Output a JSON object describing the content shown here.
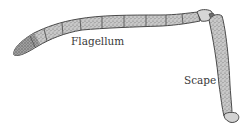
{
  "figure": {
    "labels": {
      "flagellum": "Flagellum",
      "scape": "Scape"
    },
    "colors": {
      "ink": "#4a4a4a",
      "fill": "#bdbdbd",
      "background": "#ffffff"
    }
  }
}
